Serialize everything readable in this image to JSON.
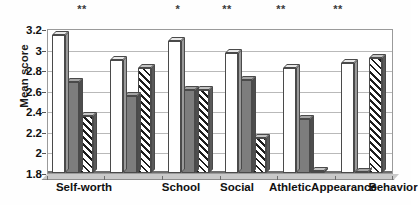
{
  "chart_data": {
    "type": "bar",
    "title": "",
    "subtitle": "",
    "xlabel": "",
    "ylabel": "Mean score",
    "ylim": [
      1.8,
      3.2
    ],
    "ytick_step": 0.2,
    "yticks": [
      "3.2",
      "3",
      "2.8",
      "2.6",
      "2.4",
      "2.2",
      "2",
      "1.8"
    ],
    "ytick_values": [
      3.2,
      3.0,
      2.8,
      2.6,
      2.4,
      2.2,
      2.0,
      1.8
    ],
    "grid": true,
    "legend": "none",
    "legend_position": "none",
    "categories": [
      "Self-worth",
      "School",
      "Social",
      "Athletic",
      "Appearance",
      "Behavior"
    ],
    "series": [
      {
        "name": "series-1",
        "style": "white",
        "values": [
          3.13,
          2.89,
          3.07,
          2.96,
          2.81,
          2.86
        ]
      },
      {
        "name": "series-2",
        "style": "gray",
        "values": [
          2.68,
          2.54,
          2.6,
          2.7,
          2.32,
          1.8
        ]
      },
      {
        "name": "series-3",
        "style": "hatched",
        "values": [
          2.35,
          2.81,
          2.6,
          2.14,
          1.82,
          2.91
        ]
      }
    ],
    "annotations": [
      {
        "label": "**",
        "category": "Self-worth"
      },
      {
        "label": "*",
        "category": "School"
      },
      {
        "label": "**",
        "category": "Social"
      },
      {
        "label": "**",
        "category": "Athletic"
      },
      {
        "label": "**",
        "category": "Appearance"
      }
    ]
  }
}
